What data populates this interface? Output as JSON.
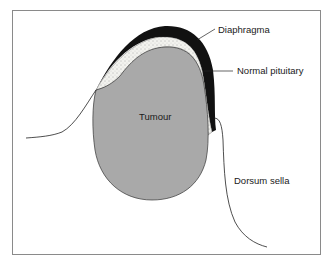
{
  "figure": {
    "labels": {
      "diaphragma": "Diaphragma",
      "normal_pituitary": "Normal pituitary",
      "tumour": "Tumour",
      "dorsum_sella": "Dorsum sella"
    },
    "colors": {
      "tumour_fill": "#a9a9a9",
      "diaphragma_fill": "#111111",
      "pituitary_fill": "#f2f2ee",
      "frame": "#8a8a8a",
      "line": "#222222"
    }
  }
}
